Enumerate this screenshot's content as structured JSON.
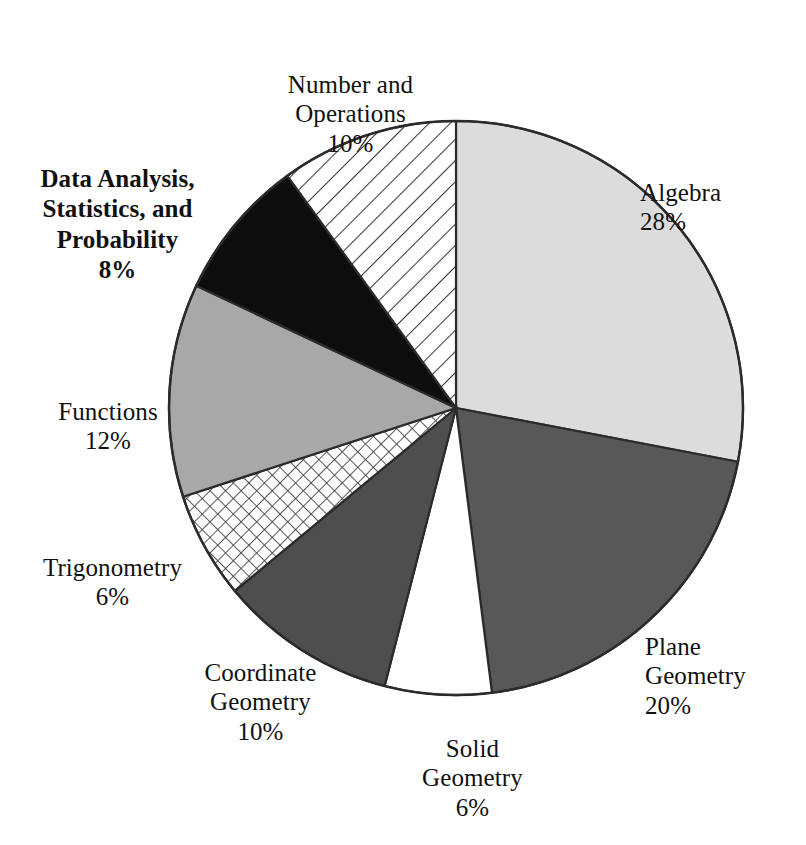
{
  "chart_data": {
    "type": "pie",
    "title": "",
    "subtitle": "",
    "xlabel": "",
    "ylabel": "",
    "legend_position": "outside-labels",
    "grid": false,
    "units": "percent",
    "total": 100,
    "start_angle_deg": 0,
    "direction": "clockwise",
    "categories": [
      "Algebra",
      "Plane Geometry",
      "Solid Geometry",
      "Coordinate Geometry",
      "Trigonometry",
      "Functions",
      "Data Analysis, Statistics, and Probability",
      "Number and Operations"
    ],
    "values": [
      28,
      20,
      6,
      10,
      6,
      12,
      8,
      10
    ],
    "slices": [
      {
        "id": "algebra",
        "name": "Algebra",
        "label_text": "Algebra",
        "value": 28,
        "percent_text": "28%",
        "fill": "#dcdcdc",
        "pattern": "solid",
        "emphasis": false
      },
      {
        "id": "plane-geometry",
        "name": "Plane Geometry",
        "label_text": "Plane\nGeometry",
        "value": 20,
        "percent_text": "20%",
        "fill": "#585858",
        "pattern": "solid",
        "emphasis": false
      },
      {
        "id": "solid-geometry",
        "name": "Solid Geometry",
        "label_text": "Solid\nGeometry",
        "value": 6,
        "percent_text": "6%",
        "fill": "#ffffff",
        "pattern": "solid",
        "emphasis": false
      },
      {
        "id": "coordinate-geometry",
        "name": "Coordinate Geometry",
        "label_text": "Coordinate\nGeometry",
        "value": 10,
        "percent_text": "10%",
        "fill": "#4e4e4e",
        "pattern": "solid",
        "emphasis": false
      },
      {
        "id": "trigonometry",
        "name": "Trigonometry",
        "label_text": "Trigonometry",
        "value": 6,
        "percent_text": "6%",
        "fill": "#ffffff",
        "pattern": "cross-hatch",
        "emphasis": false
      },
      {
        "id": "functions",
        "name": "Functions",
        "label_text": "Functions",
        "value": 12,
        "percent_text": "12%",
        "fill": "#a8a8a8",
        "pattern": "solid",
        "emphasis": false
      },
      {
        "id": "data-analysis",
        "name": "Data Analysis, Statistics, and Probability",
        "label_text": "Data Analysis,\nStatistics, and\nProbability",
        "value": 8,
        "percent_text": "8%",
        "fill": "#0d0d0d",
        "pattern": "solid",
        "emphasis": true
      },
      {
        "id": "number-operations",
        "name": "Number and Operations",
        "label_text": "Number and\nOperations",
        "value": 10,
        "percent_text": "10%",
        "fill": "#ffffff",
        "pattern": "diagonal-stripes",
        "emphasis": false
      }
    ]
  },
  "colors": {
    "outline": "#2b2b2b",
    "background": "#ffffff",
    "text": "#111111",
    "algebra": "#dcdcdc",
    "plane_geometry": "#585858",
    "solid_geometry": "#ffffff",
    "coordinate_geometry": "#4e4e4e",
    "trigonometry": "#ffffff",
    "functions": "#a8a8a8",
    "data_analysis": "#0d0d0d",
    "number_operations": "#ffffff"
  }
}
